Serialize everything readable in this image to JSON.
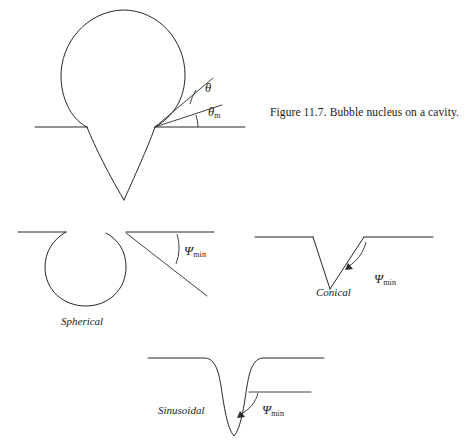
{
  "figure": {
    "caption": "Figure 11.7. Bubble nucleus on a cavity.",
    "caption_x": 270,
    "caption_y": 107,
    "background_color": "#ffffff",
    "ink_color": "#262626"
  },
  "panels": {
    "bubble_nucleus": {
      "name": "Bubble nucleus on a cavity",
      "surface_line_y": 127,
      "bubble_center_x": 123,
      "bubble_center_y": 72,
      "bubble_radius": 62,
      "cavity_tip_x": 124,
      "cavity_tip_y": 200,
      "contact_point_x": 155,
      "contact_point_y": 127,
      "angles": [
        {
          "id": "theta",
          "symbol": "θ",
          "subscript": "",
          "label_x": 205,
          "label_y": 89,
          "description": "contact angle between bubble interface tangent and cavity wall tangent"
        },
        {
          "id": "theta-m",
          "symbol": "θ",
          "subscript": "m",
          "label_x": 208,
          "label_y": 113,
          "description": "minimum contact angle measured from the horizontal surface"
        }
      ]
    },
    "spherical": {
      "name": "Spherical",
      "label": "Spherical",
      "label_x": 61,
      "label_y": 322,
      "surface_line_y": 232,
      "circle_center_x": 77,
      "circle_center_y": 267,
      "circle_radius": 32,
      "angle": {
        "id": "psi-min",
        "symbol": "Ψ",
        "subscript": "min",
        "label_x": 184,
        "label_y": 250
      }
    },
    "conical": {
      "name": "Conical",
      "label": "Conical",
      "label_x": 316,
      "label_y": 292,
      "surface_line_y": 237,
      "cavity_tip_x": 330,
      "cavity_tip_y": 289,
      "angle": {
        "id": "psi-min",
        "symbol": "Ψ",
        "subscript": "min",
        "label_x": 374,
        "label_y": 278
      }
    },
    "sinusoidal": {
      "name": "Sinusoidal",
      "label": "Sinusoidal",
      "label_x": 158,
      "label_y": 410,
      "surface_line_y": 358,
      "cavity_tip_x": 234,
      "cavity_tip_y": 436,
      "angle": {
        "id": "psi-min",
        "symbol": "Ψ",
        "subscript": "min",
        "label_x": 262,
        "label_y": 409
      }
    }
  }
}
